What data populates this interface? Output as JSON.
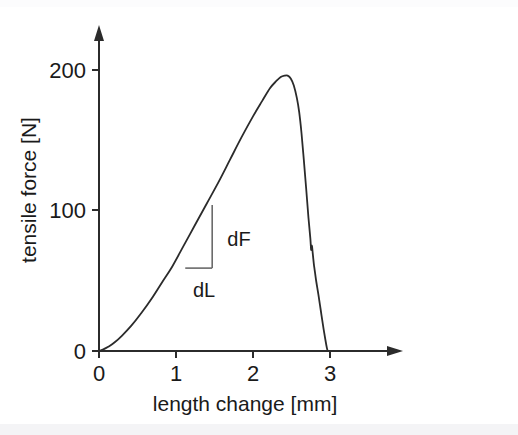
{
  "chart_data": {
    "type": "line",
    "title": "",
    "xlabel": "length change [mm]",
    "ylabel": "tensile force [N]",
    "xlim": [
      0,
      3.9
    ],
    "ylim": [
      0,
      250
    ],
    "xticks": [
      0,
      1,
      2,
      3
    ],
    "xticklabels": [
      "0",
      "1",
      "2",
      "3"
    ],
    "yticks": [
      0,
      100,
      200
    ],
    "yticklabels": [
      "0",
      "100",
      "200"
    ],
    "grid": false,
    "legend": null,
    "series": [
      {
        "name": "tensile force vs length change",
        "x": [
          0.0,
          0.05,
          0.12,
          0.2,
          0.3,
          0.42,
          0.55,
          0.68,
          0.82,
          0.95,
          1.1,
          1.25,
          1.4,
          1.55,
          1.7,
          1.85,
          2.0,
          2.12,
          2.22,
          2.3,
          2.36,
          2.41,
          2.45,
          2.49,
          2.53,
          2.57,
          2.6,
          2.63,
          2.66,
          2.69,
          2.72,
          2.745,
          2.755,
          2.765,
          2.775,
          2.79,
          2.8,
          2.82,
          2.85,
          2.88,
          2.91,
          2.94,
          2.96,
          2.97
        ],
        "y": [
          0,
          1,
          3,
          6,
          11,
          18,
          27,
          37,
          49,
          60,
          75,
          90,
          105,
          120,
          136,
          152,
          167,
          178,
          187,
          192,
          195,
          196,
          196,
          194,
          189,
          180,
          170,
          155,
          136,
          116,
          95,
          80,
          72,
          75,
          70,
          62,
          58,
          50,
          40,
          29,
          18,
          8,
          2,
          0
        ],
        "color": "#2b2b2b"
      }
    ],
    "annotations": [
      {
        "name": "slope-triangle",
        "label_vertical": "dF",
        "label_horizontal": "dL",
        "vertical_leg": {
          "x": 1.47,
          "y_from": 104,
          "y_to": 59
        },
        "horizontal_leg": {
          "y": 59,
          "x_from": 1.12,
          "x_to": 1.47
        }
      }
    ]
  },
  "axes": {
    "y_title": "tensile force [N]",
    "x_title": "length change [mm]",
    "y_tick_labels": [
      "200",
      "100",
      "0"
    ],
    "x_tick_labels": [
      "0",
      "1",
      "2",
      "3"
    ]
  },
  "annotations": {
    "dF": "dF",
    "dL": "dL"
  },
  "colors": {
    "curve": "#2b2b2b",
    "axis": "#2b2b2b",
    "triangle": "#6a6a6a",
    "background": "#ffffff",
    "text": "#1a1a1a"
  }
}
